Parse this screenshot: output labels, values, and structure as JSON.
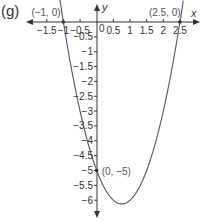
{
  "figure": {
    "part_label": "(g)"
  },
  "chart_data": {
    "type": "line",
    "title": "",
    "xlabel": "x",
    "ylabel": "y",
    "function": "y = 2x^2 - 3x - 5",
    "xlim": [
      -1.8,
      2.8
    ],
    "ylim": [
      -6.5,
      0.5
    ],
    "grid": false,
    "x_ticks": [
      -1.5,
      -1,
      -0.5,
      0.5,
      1,
      1.5,
      2,
      2.5
    ],
    "x_tick_labels": [
      "−1.5",
      "−1",
      "−0.5",
      "0.5",
      "1",
      "1.5",
      "2",
      "2.5"
    ],
    "y_ticks": [
      -0.5,
      -1,
      -1.5,
      -2,
      -2.5,
      -3,
      -3.5,
      -4,
      -4.5,
      -5,
      -5.5,
      -6
    ],
    "y_tick_labels": [
      "−0.5",
      "−1",
      "−1.5",
      "−2",
      "−2.5",
      "−3",
      "−3.5",
      "−4",
      "−4.5",
      "−5",
      "−5.5",
      "−6"
    ],
    "origin_label": "0",
    "series": [
      {
        "name": "parabola",
        "x": [
          -1.1,
          -1,
          -0.5,
          0,
          0.25,
          0.5,
          0.75,
          1,
          1.25,
          1.5,
          2,
          2.5,
          2.6
        ],
        "y": [
          0.72,
          0,
          -3,
          -5,
          -5.625,
          -6,
          -6.125,
          -6,
          -5.625,
          -5,
          -3,
          0,
          0.72
        ]
      }
    ],
    "annotations": [
      {
        "label": "(−1, 0)",
        "x": -1,
        "y": 0
      },
      {
        "label": "(2.5, 0)",
        "x": 2.5,
        "y": 0
      },
      {
        "label": "(0, −5)",
        "x": 0,
        "y": -5
      }
    ]
  }
}
